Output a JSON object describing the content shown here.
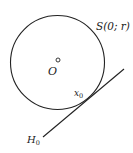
{
  "diagram": {
    "sphere_label": "S(0; r)",
    "center_label": "O",
    "tangent_point_label": "x",
    "tangent_point_subscript": "0",
    "hyperplane_label": "H",
    "hyperplane_subscript": "0",
    "stroke_color": "#222222"
  }
}
